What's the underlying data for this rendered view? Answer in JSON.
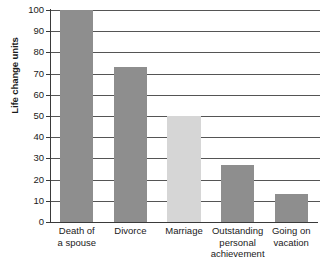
{
  "chart_data": {
    "type": "bar",
    "title": "",
    "subtitle": "",
    "xlabel": "",
    "ylabel": "Life change units",
    "ylim": [
      0,
      100
    ],
    "yticks": [
      0,
      10,
      20,
      30,
      40,
      50,
      60,
      70,
      80,
      90,
      100
    ],
    "ytick_labels": [
      "0",
      "10",
      "20",
      "30",
      "40",
      "50",
      "60",
      "70",
      "80",
      "90",
      "100"
    ],
    "grid": "horizontal",
    "legend": "none",
    "categories": [
      "Death of a spouse",
      "Divorce",
      "Marriage",
      "Outstanding personal achievement",
      "Going on vacation"
    ],
    "category_lines": [
      [
        "Death of",
        "a spouse"
      ],
      [
        "Divorce"
      ],
      [
        "Marriage"
      ],
      [
        "Outstanding",
        "personal",
        "achievement"
      ],
      [
        "Going on",
        "vacation"
      ]
    ],
    "values": [
      100,
      73,
      50,
      27,
      13
    ],
    "bar_colors": [
      "#8e8e8e",
      "#8e8e8e",
      "#d6d6d6",
      "#8e8e8e",
      "#8e8e8e"
    ],
    "axis_color": "#3a3a3a",
    "gridline_color": "#555555",
    "text_color": "#1a1a1a",
    "background": "#ffffff"
  }
}
